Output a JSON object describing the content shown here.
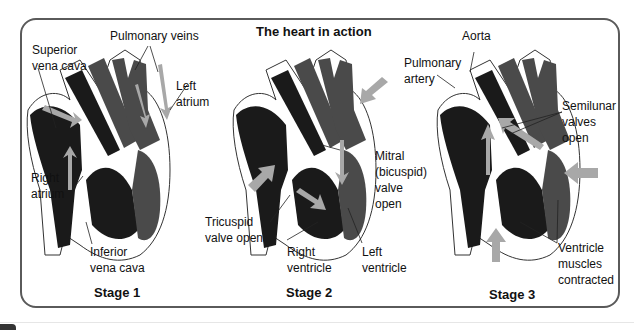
{
  "title": "The heart in action",
  "colors": {
    "deoxygenated": "#1a1a1a",
    "oxygenated": "#4a4a4a",
    "arrow": "#a8a8a8",
    "frame": "#5a5a5a"
  },
  "stages": [
    {
      "label": "Stage 1",
      "annotations": [
        "Superior\nvena cava",
        "Pulmonary veins",
        "Left\natrium",
        "Right\natrium",
        "Inferior\nvena cava"
      ]
    },
    {
      "label": "Stage 2",
      "annotations": [
        "Mitral\n(bicuspid)\nvalve\nopen",
        "Tricuspid\nvalve open",
        "Right\nventricle",
        "Left\nventricle"
      ]
    },
    {
      "label": "Stage 3",
      "annotations": [
        "Aorta",
        "Pulmonary\nartery",
        "Semilunar\nvalves\nopen",
        "Ventricle\nmuscles\ncontracted"
      ]
    }
  ]
}
